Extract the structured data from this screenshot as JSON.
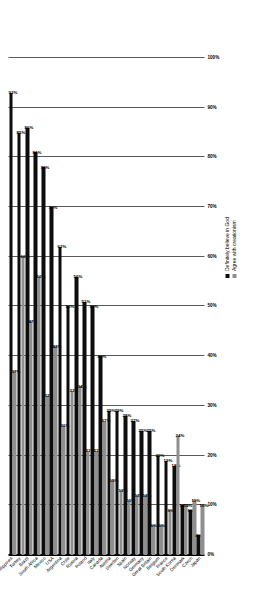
{
  "chart_data": {
    "type": "bar",
    "orientation": "vertical-rotated",
    "title": "",
    "xlabel": "",
    "ylabel": "",
    "ylim": [
      0,
      100
    ],
    "grid": true,
    "legend_position": "top-right",
    "tick_labels": [
      "100%",
      "90%",
      "80%",
      "70%",
      "60%",
      "50%",
      "40%",
      "30%",
      "20%",
      "10%",
      "0%"
    ],
    "tick_values": [
      100,
      90,
      80,
      70,
      60,
      50,
      40,
      30,
      20,
      10,
      0
    ],
    "categories": [
      "Philippines",
      "Turkey",
      "Brazil",
      "South Africa",
      "Mexico",
      "USA",
      "Argentina",
      "Chile",
      "Russia",
      "Poland",
      "Italy",
      "Canada",
      "Austria",
      "Sweden",
      "Spain",
      "Norway",
      "Germany",
      "Great Britain",
      "Belgium",
      "France",
      "South Korea",
      "Denmark",
      "Czech",
      "Japan"
    ],
    "series": [
      {
        "name": "Definitely believe in God",
        "color": "#0d0d0d",
        "values": [
          93,
          85,
          86,
          81,
          78,
          70,
          62,
          50,
          56,
          51,
          50,
          40,
          29,
          29,
          28,
          27,
          25,
          25,
          20,
          19,
          18,
          10,
          9,
          4
        ],
        "labels": [
          "93%",
          "85%",
          "86%",
          "81%",
          "78%",
          "70%",
          "62%",
          "50%",
          "56%",
          "51%",
          "50%",
          "40%",
          "29%",
          "29%",
          "28%",
          "27%",
          "25%",
          "25%",
          "20%",
          "19%",
          "18%",
          "10%",
          "9%",
          "4%"
        ]
      },
      {
        "name": "Agree with creationism",
        "color": "#8f8f8f",
        "values": [
          37,
          60,
          47,
          56,
          32,
          42,
          26,
          33,
          34,
          21,
          21,
          27,
          15,
          13,
          11,
          12,
          12,
          6,
          6,
          9,
          24,
          10,
          11,
          10
        ],
        "labels": [
          "37%",
          "60%",
          "47%",
          "56%",
          "32%",
          "42%",
          "26%",
          "33%",
          "34%",
          "21%",
          "21%",
          "27%",
          "15%",
          "13%",
          "11%",
          "12%",
          "12%",
          "6%",
          "6%",
          "9%",
          "24%",
          "10%",
          "11%",
          "10%"
        ]
      }
    ]
  },
  "legend": {
    "items": [
      {
        "label": "Definitely believe in God",
        "color": "#0d0d0d"
      },
      {
        "label": "Agree with creationism",
        "color": "#8f8f8f"
      }
    ]
  }
}
